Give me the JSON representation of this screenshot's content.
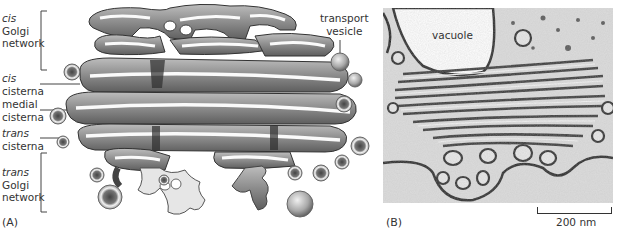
{
  "panel_a": {
    "label": "(A)",
    "labels": {
      "cis_golgi_network": {
        "italic": "cis",
        "line2": "Golgi",
        "line3": "network"
      },
      "cis_cisterna": {
        "italic": "cis",
        "line2": "cisterna"
      },
      "medial_cisterna": {
        "line1": "medial",
        "line2": "cisterna"
      },
      "trans_cisterna": {
        "italic": "trans",
        "line2": "cisterna"
      },
      "trans_golgi_network": {
        "italic": "trans",
        "line2": "Golgi",
        "line3": "network"
      },
      "transport_vesicle": {
        "line1": "transport",
        "line2": "vesicle"
      }
    }
  },
  "panel_b": {
    "label": "(B)",
    "vacuole_label": "vacuole",
    "scale_bar": "200 nm"
  },
  "colors": {
    "line": "#333333",
    "membrane_dark": "#3a3a3a",
    "membrane_mid": "#8a8a8a",
    "lumen_light": "#f4f4f4",
    "micrograph_bg": "#d9d9d9"
  }
}
